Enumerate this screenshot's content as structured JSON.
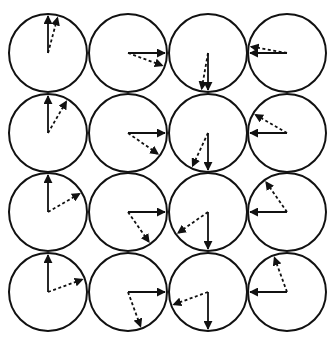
{
  "grid": {
    "rows": 4,
    "cols": 4
  },
  "colors": {
    "stroke": "#111111",
    "background": "#ffffff"
  },
  "cells": [
    [
      {
        "solid_deg": 0,
        "dashed_deg": 15
      },
      {
        "solid_deg": 90,
        "dashed_deg": 110
      },
      {
        "solid_deg": 180,
        "dashed_deg": 190
      },
      {
        "solid_deg": 270,
        "dashed_deg": 280
      }
    ],
    [
      {
        "solid_deg": 0,
        "dashed_deg": 30
      },
      {
        "solid_deg": 90,
        "dashed_deg": 125
      },
      {
        "solid_deg": 180,
        "dashed_deg": 205
      },
      {
        "solid_deg": 270,
        "dashed_deg": 300
      }
    ],
    [
      {
        "solid_deg": 0,
        "dashed_deg": 60
      },
      {
        "solid_deg": 90,
        "dashed_deg": 145
      },
      {
        "solid_deg": 180,
        "dashed_deg": 235
      },
      {
        "solid_deg": 270,
        "dashed_deg": 325
      }
    ],
    [
      {
        "solid_deg": 0,
        "dashed_deg": 70
      },
      {
        "solid_deg": 90,
        "dashed_deg": 160
      },
      {
        "solid_deg": 180,
        "dashed_deg": 250
      },
      {
        "solid_deg": 270,
        "dashed_deg": 340
      }
    ]
  ],
  "legend": {
    "solid": "reference vector",
    "dashed": "rotated vector"
  }
}
